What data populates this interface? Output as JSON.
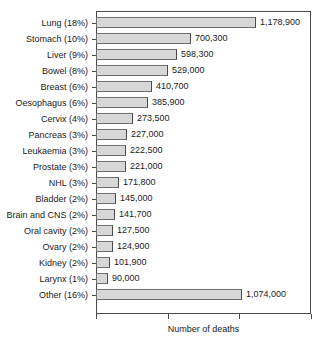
{
  "chart_data": {
    "type": "bar",
    "orientation": "horizontal",
    "title": "",
    "xlabel": "Number of deaths",
    "ylabel": "",
    "grid": false,
    "legend": null,
    "xlim": [
      0,
      1586000
    ],
    "x_tick_labels": [
      "",
      "",
      "",
      ""
    ],
    "categories": [
      "Lung (18%)",
      "Stomach (10%)",
      "Liver (9%)",
      "Bowel (8%)",
      "Breast (6%)",
      "Oesophagus (6%)",
      "Cervix (4%)",
      "Pancreas (3%)",
      "Leukaemia (3%)",
      "Prostate (3%)",
      "NHL (3%)",
      "Bladder (2%)",
      "Brain and CNS (2%)",
      "Oral cavity (2%)",
      "Ovary (2%)",
      "Kidney (2%)",
      "Larynx (1%)",
      "Other (16%)"
    ],
    "values": [
      1178900,
      700300,
      598300,
      529000,
      410700,
      385900,
      273500,
      227000,
      222500,
      221000,
      171800,
      145000,
      141700,
      127500,
      124900,
      101900,
      90000,
      1074000
    ],
    "value_labels": [
      "1,178,900",
      "700,300",
      "598,300",
      "529,000",
      "410,700",
      "385,900",
      "273,500",
      "227,000",
      "222,500",
      "221,000",
      "171,800",
      "145,000",
      "141,700",
      "127,500",
      "124,900",
      "101,900",
      "90,000",
      "1,074,000"
    ],
    "percentages": [
      "18%",
      "10%",
      "9%",
      "8%",
      "6%",
      "6%",
      "4%",
      "3%",
      "3%",
      "3%",
      "3%",
      "2%",
      "2%",
      "2%",
      "2%",
      "2%",
      "1%",
      "16%"
    ],
    "bar_fill_color": "#d7d7d7",
    "bar_border_color": "#6e6e6e",
    "axis_color": "#4a4a4a",
    "text_color": "#1a1a1a",
    "background_color": "#ffffff"
  }
}
